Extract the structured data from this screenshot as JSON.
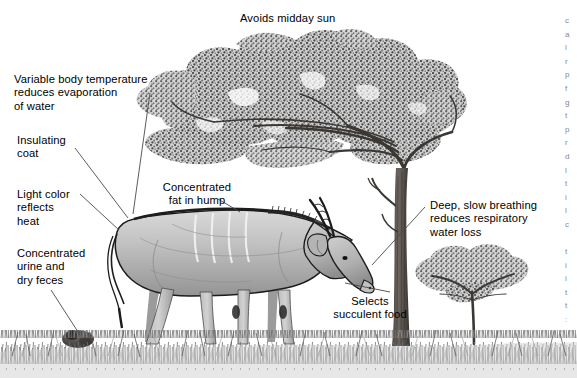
{
  "figure": {
    "name": "eland-desert-adaptations-diagram",
    "alt": "Grayscale illustration of an eland grazing beneath an acacia tree with labelled desert adaptations",
    "background_color": "#ffffff",
    "ink_color": "#000000",
    "leader_line_color": "#4a4a4a",
    "width": 577,
    "height": 378
  },
  "labels": [
    {
      "id": "avoids-midday-sun",
      "text": "Avoids midday sun",
      "x": 240,
      "y": 12,
      "align": "left",
      "leader": null
    },
    {
      "id": "variable-body-temperature",
      "text": "Variable body temperature\nreduces evaporation\nof water",
      "x": 14,
      "y": 73,
      "align": "left",
      "leader": {
        "x1": 150,
        "y1": 93,
        "x2": 133,
        "y2": 214
      }
    },
    {
      "id": "insulating-coat",
      "text": "Insulating\ncoat",
      "x": 17,
      "y": 134,
      "align": "left",
      "leader": {
        "x1": 75,
        "y1": 148,
        "x2": 128,
        "y2": 218
      }
    },
    {
      "id": "light-color-reflects-heat",
      "text": "Light color\nreflects\nheat",
      "x": 17,
      "y": 188,
      "align": "left",
      "leader": {
        "x1": 80,
        "y1": 194,
        "x2": 119,
        "y2": 230
      }
    },
    {
      "id": "concentrated-urine-dry-feces",
      "text": "Concentrated\nurine and\ndry feces",
      "x": 17,
      "y": 247,
      "align": "left",
      "leader": {
        "x1": 51,
        "y1": 290,
        "x2": 80,
        "y2": 335
      }
    },
    {
      "id": "concentrated-fat-in-hump",
      "text": "Concentrated\nfat in hump",
      "x": 153,
      "y": 181,
      "align": "center",
      "leader": {
        "x1": 218,
        "y1": 199,
        "x2": 240,
        "y2": 212
      }
    },
    {
      "id": "deep-slow-breathing",
      "text": "Deep, slow breathing\nreduces respiratory\nwater loss",
      "x": 430,
      "y": 199,
      "align": "left",
      "leader": {
        "x1": 425,
        "y1": 207,
        "x2": 372,
        "y2": 265
      }
    },
    {
      "id": "selects-succulent-food",
      "text": "Selects\nsucculent food",
      "x": 324,
      "y": 295,
      "align": "center",
      "leader": {
        "x1": 390,
        "y1": 292,
        "x2": 345,
        "y2": 283
      }
    }
  ],
  "edge_text_column": {
    "id": "cropped-right-margin-text",
    "note": "narrow sliver of a cropped text column at the right edge",
    "fragments": [
      "c",
      "a",
      "l",
      "r",
      "p",
      "f",
      "g",
      "t",
      "p",
      "r",
      "d",
      "l",
      "t",
      "i",
      "l",
      "c",
      "",
      "t",
      "i",
      "i",
      "t",
      "t",
      ":"
    ]
  },
  "scene": {
    "animal": "eland",
    "tree_main": "flat-topped acacia",
    "tree_background": "small acacia",
    "ground": "dry savanna grass",
    "dung": "dung mound"
  }
}
